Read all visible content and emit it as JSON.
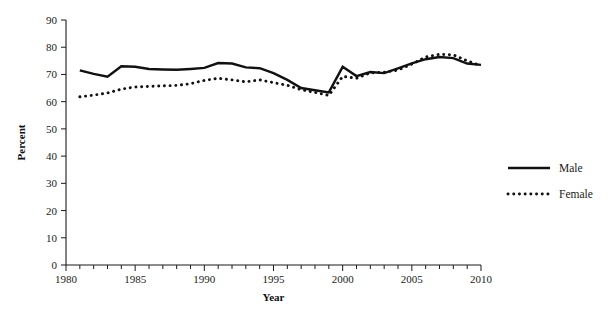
{
  "chart_data": {
    "type": "line",
    "title": "",
    "xlabel": "Year",
    "ylabel": "Percent",
    "xlim": [
      1980,
      2010
    ],
    "ylim": [
      0,
      90
    ],
    "ytick_step": 10,
    "xtick_major_step": 5,
    "xtick_minor_step": 1,
    "grid": false,
    "legend_position": "right",
    "yticks": [
      "0",
      "10",
      "20",
      "30",
      "40",
      "50",
      "60",
      "70",
      "80",
      "90"
    ],
    "xticks": [
      "1980",
      "1985",
      "1990",
      "1995",
      "2000",
      "2005",
      "2010"
    ],
    "x": [
      1981,
      1982,
      1983,
      1984,
      1985,
      1986,
      1987,
      1988,
      1989,
      1990,
      1991,
      1992,
      1993,
      1994,
      1995,
      1996,
      1997,
      1998,
      1999,
      2000,
      2001,
      2002,
      2003,
      2004,
      2005,
      2006,
      2007,
      2008,
      2009,
      2010
    ],
    "series": [
      {
        "name": "Male",
        "style": "solid",
        "color": "#111111",
        "values": [
          71.5,
          70.2,
          69.2,
          73.0,
          72.8,
          72.0,
          71.8,
          71.7,
          72.0,
          72.4,
          74.2,
          74.0,
          72.6,
          72.3,
          70.5,
          68.0,
          65.0,
          64.2,
          63.4,
          72.8,
          69.4,
          70.9,
          70.5,
          72.2,
          74.1,
          75.6,
          76.4,
          76.0,
          74.0,
          73.5
        ]
      },
      {
        "name": "Female",
        "style": "dotted",
        "color": "#111111",
        "values": [
          61.8,
          62.4,
          63.2,
          64.6,
          65.4,
          65.6,
          65.8,
          66.0,
          66.6,
          67.8,
          68.6,
          68.0,
          67.3,
          68.0,
          67.0,
          66.0,
          64.4,
          63.4,
          62.3,
          69.3,
          68.6,
          70.6,
          70.8,
          71.6,
          73.8,
          76.4,
          77.4,
          77.2,
          75.0,
          73.2
        ]
      }
    ]
  },
  "legend": {
    "items": [
      {
        "label": "Male",
        "style": "solid"
      },
      {
        "label": "Female",
        "style": "dotted"
      }
    ]
  },
  "axes": {
    "y_title": "Percent",
    "x_title": "Year"
  }
}
